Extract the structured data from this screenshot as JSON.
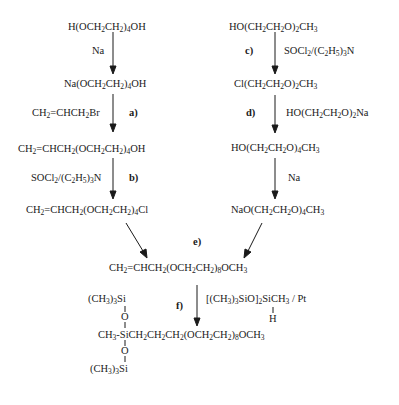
{
  "left_chain": {
    "compound_1": "H(OCH2CH2)4OH",
    "reagent_1": "Na",
    "compound_2": "Na(OCH2CH2)4OH",
    "reagent_2": "CH2=CHCH2Br",
    "step_a": "a)",
    "compound_3": "CH2=CHCH2(OCH2CH2)4OH",
    "reagent_3": "SOCl2/(C2H5)3N",
    "step_b": "b)",
    "compound_4": "CH2=CHCH2(OCH2CH2)4Cl"
  },
  "right_chain": {
    "compound_1": "HO(CH2CH2O)2CH3",
    "step_c": "c)",
    "reagent_1": "SOCl2/(C2H5)3N",
    "compound_2": "Cl(CH2CH2O)2CH3",
    "step_d": "d)",
    "reagent_2": "HO(CH2CH2O)2Na",
    "compound_3": "HO(CH2CH2O)4CH3",
    "reagent_3": "Na",
    "compound_4": "NaO(CH2CH2O)4CH3"
  },
  "merge": {
    "step_e": "e)",
    "product": "CH2=CHCH2(OCH2CH2)8OCH3"
  },
  "final": {
    "step_f": "f)",
    "reagent": "[(CH3)3SiO]2SiCH3 / Pt",
    "reagent_h": "H",
    "top_group": "(CH3)3Si",
    "bottom_group": "(CH3)3Si",
    "o_top": "O",
    "o_bottom": "O",
    "product": "CH3-SiCH2CH2CH2(OCH2CH2)8OCH3"
  }
}
